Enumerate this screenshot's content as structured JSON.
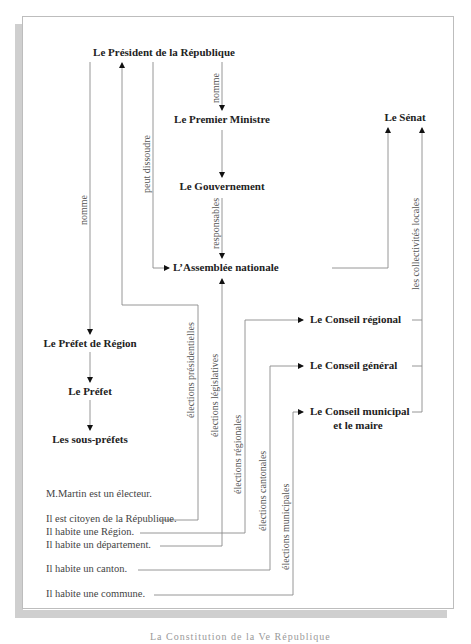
{
  "diagram": {
    "nodes": {
      "president": "Le Président de la République",
      "premier_ministre": "Le Premier Ministre",
      "gouvernement": "Le Gouvernement",
      "assemblee": "L’Assemblée nationale",
      "senat": "Le Sénat",
      "prefet_region": "Le Préfet de Région",
      "prefet": "Le Préfet",
      "sous_prefets": "Les sous-préfets",
      "conseil_regional": "Le Conseil régional",
      "conseil_general": "Le Conseil général",
      "conseil_municipal_line1": "Le Conseil municipal",
      "conseil_municipal_line2": "et le maire"
    },
    "edge_labels": {
      "nomme_prefet": "nomme",
      "nomme_pm": "nomme",
      "peut_dissoudre": "peut dissoudre",
      "responsables": "responsables",
      "collectivites": "les collectivités locales",
      "presidentielles": "élections présidentielles",
      "legislatives": "élections législatives",
      "regionales": "élections régionales",
      "cantonales": "élections cantonales",
      "municipales": "élections municipales"
    },
    "voter_lines": [
      "M.Martin est un électeur.",
      "Il est citoyen de la République.",
      "Il habite une Région.",
      "Il habite un département.",
      "Il habite un canton.",
      "Il habite une commune."
    ],
    "colors": {
      "line": "#8a8a8a",
      "arrow": "#111111",
      "node_text": "#222222",
      "label_text": "#555555",
      "shadow": "#cfcfcf"
    }
  },
  "caption": "La Constitution de la Ve République"
}
